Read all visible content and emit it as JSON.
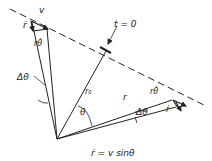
{
  "diagram": {
    "labels": {
      "v_top": "v",
      "rdot_top": "ṙ",
      "rthetadot_top": "rθ̇",
      "delta_theta_left": "Δθ",
      "t_zero": "t = 0",
      "r0": "r₀",
      "theta": "θ",
      "r_right": "r",
      "rthetadot_right": "rθ̇",
      "rdot_right": "ṙ",
      "delta_theta_right": "Δθ",
      "equation": "ṙ = v sinθ"
    },
    "elements": [
      "dashed-trajectory-line",
      "origin-vertex",
      "radius-left",
      "radius-r0-perpendicular",
      "radius-right",
      "velocity-triangle-left",
      "velocity-triangle-right"
    ],
    "colors": {
      "ink": "#222222",
      "background": "#ffffff"
    }
  }
}
